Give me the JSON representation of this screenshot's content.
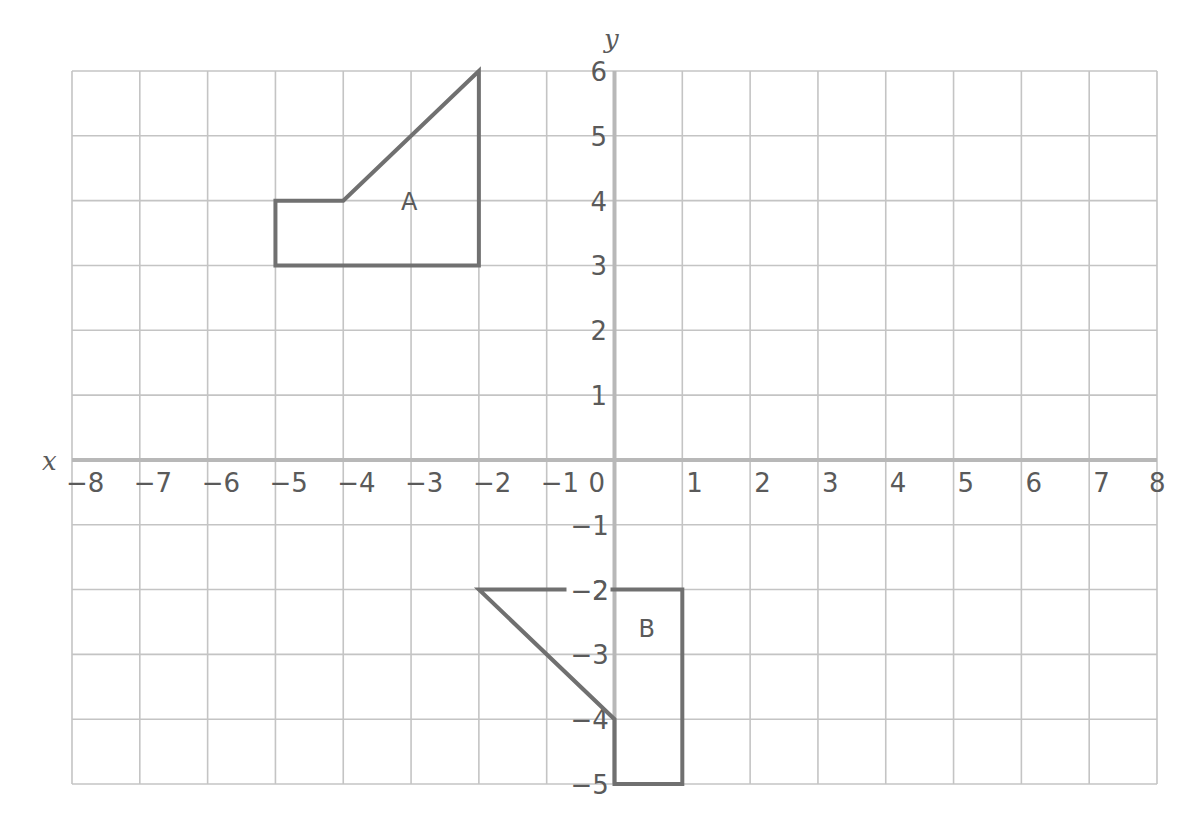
{
  "diagram": {
    "type": "coordinate-grid",
    "x_axis": {
      "label": "x",
      "min": -8,
      "max": 8,
      "ticks": [
        "−8",
        "−7",
        "−6",
        "−5",
        "−4",
        "−3",
        "−2",
        "−1",
        "0",
        "1",
        "2",
        "3",
        "4",
        "5",
        "6",
        "7",
        "8"
      ]
    },
    "y_axis": {
      "label": "y",
      "min": -5,
      "max": 6,
      "ticks": [
        "6",
        "5",
        "4",
        "3",
        "2",
        "1",
        "−1",
        "−2",
        "−3",
        "−4",
        "−5"
      ]
    },
    "colors": {
      "grid": "#c4c4c4",
      "axis": "#b8b8b8",
      "shape": "#707070",
      "text": "#5a5a5a"
    },
    "shapes": [
      {
        "label": "A",
        "vertices": [
          [
            -5,
            3
          ],
          [
            -5,
            4
          ],
          [
            -4,
            4
          ],
          [
            -2,
            6
          ],
          [
            -2,
            3
          ]
        ],
        "label_pos": [
          -3,
          4
        ]
      },
      {
        "label": "B",
        "vertices": [
          [
            -2,
            -2
          ],
          [
            1,
            -2
          ],
          [
            1,
            -5
          ],
          [
            0,
            -5
          ],
          [
            0,
            -4
          ]
        ],
        "label_pos": [
          0.5,
          -2.6
        ]
      }
    ]
  }
}
